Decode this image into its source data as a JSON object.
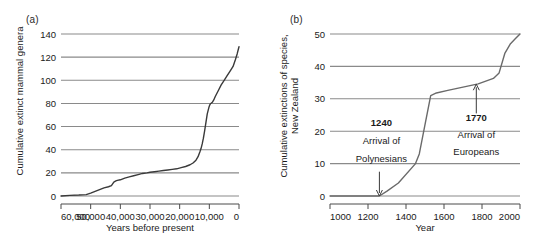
{
  "figure": {
    "panel_a_label": "(a)",
    "panel_b_label": "(b)"
  },
  "chart_data": [
    {
      "panel": "(a)",
      "type": "line",
      "title": "",
      "xlabel": "Years before present",
      "ylabel": "Cumulative extinct mammal genera",
      "xlim": [
        60000,
        0
      ],
      "ylim": [
        0,
        140
      ],
      "x_reversed": true,
      "xticks": [
        60000,
        50000,
        40000,
        30000,
        20000,
        10000,
        0
      ],
      "xticklabels": [
        "60,000",
        "50,000",
        "40,000",
        "30,000",
        "20,000",
        "10,000",
        "0"
      ],
      "yticks": [
        0,
        20,
        40,
        60,
        80,
        100,
        120,
        140
      ],
      "yticklabels": [
        "0",
        "20",
        "40",
        "60",
        "80",
        "100",
        "120",
        "140"
      ],
      "grid": "horizontal",
      "legend": "none",
      "line_color": "#3a3a3a",
      "grid_color": "#8a8a8a",
      "series": [
        {
          "name": "Cumulative extinct mammal genera",
          "x": [
            60000,
            57000,
            54000,
            51500,
            50000,
            48500,
            47000,
            45500,
            44000,
            43000,
            42200,
            41500,
            41000,
            40000,
            38500,
            37000,
            35500,
            34000,
            32500,
            31000,
            30000,
            28500,
            27000,
            25500,
            24000,
            22500,
            21000,
            19500,
            18000,
            16500,
            15500,
            14500,
            13800,
            13200,
            12800,
            12400,
            12000,
            11600,
            11300,
            11000,
            10700,
            10400,
            10100,
            9800,
            9500,
            9000,
            8500,
            8000,
            7000,
            6000,
            5000,
            4000,
            3000,
            2000,
            1200,
            600,
            200,
            0
          ],
          "y": [
            0,
            0.5,
            0.8,
            1.2,
            2.5,
            4,
            5.5,
            7,
            8,
            9,
            12,
            13,
            13.5,
            14,
            15.5,
            16.5,
            17.5,
            18.5,
            19.5,
            20,
            20.5,
            21,
            21.5,
            22,
            22.5,
            23,
            23.5,
            24.5,
            25.5,
            27,
            28.5,
            31,
            34,
            38,
            41,
            45,
            50,
            56,
            61,
            66,
            71,
            74,
            77,
            79,
            80,
            81,
            83,
            86,
            91,
            96,
            100,
            104,
            108,
            112,
            118,
            123,
            127,
            129
          ]
        }
      ]
    },
    {
      "panel": "(b)",
      "type": "line",
      "title": "",
      "xlabel": "Year",
      "ylabel": "Cumulative extinctions of species, New Zealand",
      "ylabel_lines": [
        "Cumulative extinctions of species,",
        "New Zealand"
      ],
      "xlim": [
        1000,
        2000
      ],
      "ylim": [
        0,
        50
      ],
      "x_reversed": false,
      "xticks": [
        1000,
        1200,
        1400,
        1600,
        1800,
        2000
      ],
      "xticklabels": [
        "1000",
        "1200",
        "1400",
        "1600",
        "1800",
        "2000"
      ],
      "yticks": [
        0,
        10,
        20,
        30,
        40,
        50
      ],
      "yticklabels": [
        "0",
        "10",
        "20",
        "30",
        "40",
        "50"
      ],
      "grid": "horizontal",
      "legend": "none",
      "line_color": "#6a6a6a",
      "grid_color": "#8a8a8a",
      "series": [
        {
          "name": "Cumulative extinctions of species, New Zealand",
          "x": [
            1000,
            1260,
            1300,
            1360,
            1450,
            1470,
            1500,
            1530,
            1560,
            1620,
            1700,
            1780,
            1860,
            1890,
            1920,
            1950,
            1975,
            2000
          ],
          "y": [
            0,
            0,
            1.5,
            4,
            10,
            13,
            22,
            31,
            31.8,
            32.6,
            33.6,
            34.6,
            36.3,
            38,
            44,
            47,
            48.5,
            50
          ]
        }
      ],
      "annotations": [
        {
          "name": "polynesian-arrival",
          "year_label": "1240",
          "text_lines": [
            "Arrival of",
            "Polynesians"
          ],
          "arrow": "down",
          "points_to_x": 1260,
          "points_to_y": 0
        },
        {
          "name": "european-arrival",
          "year_label": "1770",
          "text_lines": [
            "Arrival of",
            "Europeans"
          ],
          "arrow": "up",
          "points_to_x": 1770,
          "points_to_y": 34.5
        }
      ]
    }
  ]
}
